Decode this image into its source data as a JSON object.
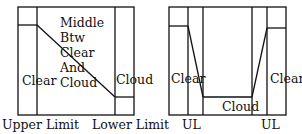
{
  "left_diagram": {
    "left_label": "Clear",
    "middle_lines": [
      "Middle",
      "Btw",
      "Clear",
      "And",
      "Cloud"
    ],
    "right_label": "Cloud",
    "bottom_left": "Upper Limit",
    "bottom_right": "Lower Limit"
  },
  "right_diagram": {
    "left_label": "Clear",
    "center_label": "Cloud",
    "right_label": "Clear",
    "bottom_left": "UL",
    "bottom_right": "UL"
  },
  "colors": {
    "line": "#111111",
    "background": "#ffffff"
  }
}
